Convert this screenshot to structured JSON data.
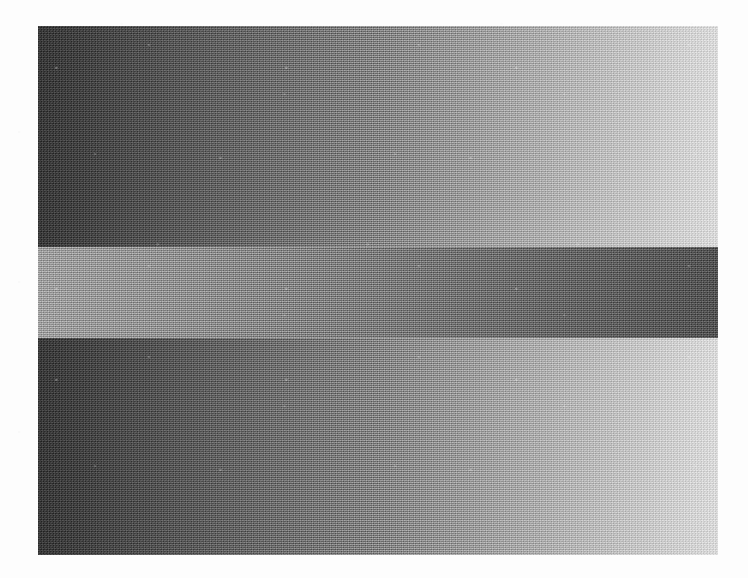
{
  "page": {
    "background_color": "#fdfdfd",
    "width": 748,
    "height": 578,
    "caption": ""
  },
  "figure": {
    "name": "simultaneous-contrast-gradient-figure",
    "panel": {
      "left": 38,
      "top": 26,
      "width": 680,
      "height": 529,
      "border": "none"
    },
    "bands": [
      {
        "id": "band-top",
        "label": "Top ramp",
        "top": 0,
        "height": 221,
        "direction": "left-to-right",
        "start_color": "#2f2f2f",
        "mid_color": "#808080",
        "end_color": "#dedede",
        "polarity": "dark-to-light"
      },
      {
        "id": "band-middle",
        "label": "Middle reversed ramp",
        "top": 221,
        "height": 91,
        "direction": "left-to-right",
        "start_color": "#9e9e9e",
        "mid_color": "#767676",
        "end_color": "#4b4b4b",
        "polarity": "light-to-dark"
      },
      {
        "id": "band-bottom",
        "label": "Bottom ramp",
        "top": 312,
        "height": 217,
        "direction": "left-to-right",
        "start_color": "#2f2f2f",
        "mid_color": "#808080",
        "end_color": "#dedede",
        "polarity": "dark-to-light"
      }
    ],
    "texture": {
      "type": "halftone-scan-grain",
      "visible": true
    }
  },
  "chart_data": {
    "type": "heatmap",
    "title": "",
    "xlabel": "",
    "ylabel": "",
    "x": [
      0,
      0.125,
      0.25,
      0.375,
      0.5,
      0.625,
      0.75,
      0.875,
      1
    ],
    "series": [
      {
        "name": "Top ramp luminance",
        "values": [
          47,
          72,
          98,
          123,
          128,
          152,
          178,
          203,
          222
        ]
      },
      {
        "name": "Middle reversed ramp luminance",
        "values": [
          158,
          146,
          134,
          122,
          118,
          106,
          94,
          86,
          75
        ]
      },
      {
        "name": "Bottom ramp luminance",
        "values": [
          47,
          72,
          98,
          123,
          128,
          152,
          178,
          203,
          222
        ]
      }
    ],
    "ylim": [
      0,
      255
    ],
    "grid": false,
    "legend_position": "none",
    "annotations": []
  }
}
